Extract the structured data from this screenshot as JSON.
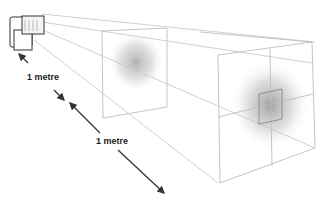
{
  "diagram": {
    "labels": {
      "distance_1": "1 metre",
      "distance_2": "1 metre"
    },
    "colors": {
      "line": "#bdbdbd",
      "arrow": "#333333",
      "flash_outline": "#333333",
      "light_spot": "#9a9a9a"
    }
  }
}
